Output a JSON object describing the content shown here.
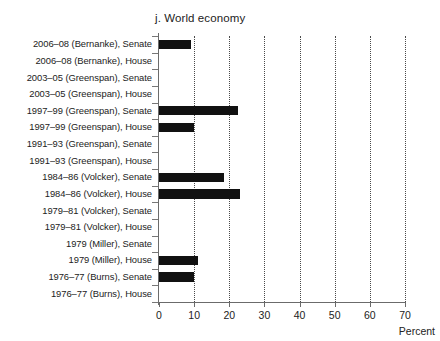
{
  "chart_data": {
    "type": "bar",
    "orientation": "horizontal",
    "title": "j. World economy",
    "xlabel": "Percent",
    "ylabel": "",
    "xlim": [
      0,
      70
    ],
    "xticks": [
      0,
      10,
      20,
      30,
      40,
      50,
      60,
      70
    ],
    "xtick_labels": [
      "0",
      "10",
      "20",
      "30",
      "40",
      "50",
      "60",
      "70"
    ],
    "grid": "vertical-dotted",
    "legend": "none",
    "bar_color": "#111111",
    "categories": [
      "2006–08 (Bernanke), Senate",
      "2006–08 (Bernanke), House",
      "2003–05 (Greenspan), Senate",
      "2003–05 (Greenspan), House",
      "1997–99 (Greenspan), Senate",
      "1997–99 (Greenspan), House",
      "1991–93 (Greenspan), Senate",
      "1991–93 (Greenspan), House",
      "1984–86 (Volcker), Senate",
      "1984–86 (Volcker), House",
      "1979–81 (Volcker), Senate",
      "1979–81 (Volcker), House",
      "1979 (Miller), Senate",
      "1979 (Miller), House",
      "1976–77 (Burns), Senate",
      "1976–77 (Burns), House"
    ],
    "values": [
      9,
      0,
      0,
      0,
      22.5,
      10,
      0,
      0,
      18.5,
      23,
      0,
      0,
      0,
      11,
      10,
      0
    ]
  }
}
